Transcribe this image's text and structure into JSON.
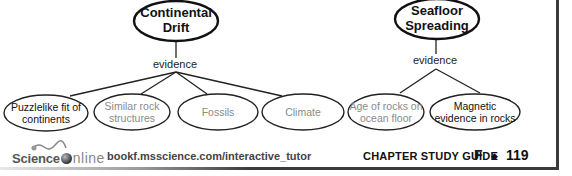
{
  "concept_maps": [
    {
      "main": {
        "line1": "Continental",
        "line2": "Drift"
      },
      "link_label": "evidence",
      "children": [
        {
          "line1": "Puzzlelike fit of",
          "line2": "continents",
          "state": "filled"
        },
        {
          "line1": "Similar rock",
          "line2": "structures",
          "state": "blank"
        },
        {
          "line1": "Fossils",
          "line2": "",
          "state": "blank"
        },
        {
          "line1": "Climate",
          "line2": "",
          "state": "blank"
        }
      ]
    },
    {
      "main": {
        "line1": "Seafloor",
        "line2": "Spreading"
      },
      "link_label": "evidence",
      "children": [
        {
          "line1": "Age of rocks on",
          "line2": "ocean floor",
          "state": "blank"
        },
        {
          "line1": "Magnetic",
          "line2": "evidence in rocks",
          "state": "filled"
        }
      ]
    }
  ],
  "footer": {
    "logo_science": "Science",
    "logo_online": "nline",
    "url": "bookf.msscience.com/interactive_tutor",
    "guide_label": "CHAPTER STUDY GUIDE",
    "book_letter": "F",
    "separator": "◆",
    "page_number": "119"
  },
  "colors": {
    "filled_text": "#111111",
    "blank_text": "#8a8a8a",
    "frame": "#3a3a3a"
  }
}
